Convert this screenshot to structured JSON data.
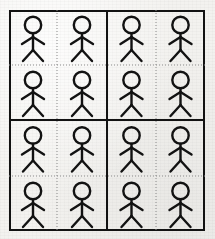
{
  "image": {
    "title": "Stick figure grid",
    "description": "A hand-drawn style 4 by 4 grid of identical stick figures on textured paper",
    "width": 215,
    "height": 239,
    "background_color": "#f3f2ef",
    "ink_color": "#121212",
    "divider_color": "#8c8c8c"
  },
  "frame": {
    "name": "outer-border",
    "x": 9,
    "y": 10,
    "width": 196,
    "height": 221,
    "stroke_width": 2,
    "stroke_color": "#121212"
  },
  "grid": {
    "rows": 4,
    "columns": 4,
    "total_cells": 16,
    "quadrant_rows": 2,
    "quadrant_columns": 2,
    "cells_per_quadrant": 4,
    "column_x": [
      9,
      57,
      107,
      156,
      205
    ],
    "row_y": [
      10,
      65,
      120,
      176,
      231
    ],
    "solid_divider_x": [
      107
    ],
    "solid_divider_y": [
      120
    ],
    "dotted_divider_x": [
      57,
      156
    ],
    "dotted_divider_y": [
      65,
      176
    ],
    "solid_divider_width": 2,
    "dotted_divider_width": 1,
    "dotted_dash_pattern": "1 2"
  },
  "figure": {
    "name": "stick-figure",
    "label": "stick figure",
    "stroke_color": "#121212",
    "stroke_width": 2.4,
    "head_radius": 8.2,
    "head_center_y": 11,
    "torso_top_y": 19.2,
    "torso_bottom_y": 36,
    "arm_y": 23,
    "arm_span": 11,
    "arm_drop": 7,
    "leg_span": 10,
    "leg_bottom_y": 47
  },
  "cells": [
    {
      "row": 1,
      "col": 1,
      "quadrant": "top-left",
      "figure": "stick-figure"
    },
    {
      "row": 1,
      "col": 2,
      "quadrant": "top-left",
      "figure": "stick-figure"
    },
    {
      "row": 1,
      "col": 3,
      "quadrant": "top-right",
      "figure": "stick-figure"
    },
    {
      "row": 1,
      "col": 4,
      "quadrant": "top-right",
      "figure": "stick-figure"
    },
    {
      "row": 2,
      "col": 1,
      "quadrant": "top-left",
      "figure": "stick-figure"
    },
    {
      "row": 2,
      "col": 2,
      "quadrant": "top-left",
      "figure": "stick-figure"
    },
    {
      "row": 2,
      "col": 3,
      "quadrant": "top-right",
      "figure": "stick-figure"
    },
    {
      "row": 2,
      "col": 4,
      "quadrant": "top-right",
      "figure": "stick-figure"
    },
    {
      "row": 3,
      "col": 1,
      "quadrant": "bottom-left",
      "figure": "stick-figure"
    },
    {
      "row": 3,
      "col": 2,
      "quadrant": "bottom-left",
      "figure": "stick-figure"
    },
    {
      "row": 3,
      "col": 3,
      "quadrant": "bottom-right",
      "figure": "stick-figure"
    },
    {
      "row": 3,
      "col": 4,
      "quadrant": "bottom-right",
      "figure": "stick-figure"
    },
    {
      "row": 4,
      "col": 1,
      "quadrant": "bottom-left",
      "figure": "stick-figure"
    },
    {
      "row": 4,
      "col": 2,
      "quadrant": "bottom-left",
      "figure": "stick-figure"
    },
    {
      "row": 4,
      "col": 3,
      "quadrant": "bottom-right",
      "figure": "stick-figure"
    },
    {
      "row": 4,
      "col": 4,
      "quadrant": "bottom-right",
      "figure": "stick-figure"
    }
  ]
}
